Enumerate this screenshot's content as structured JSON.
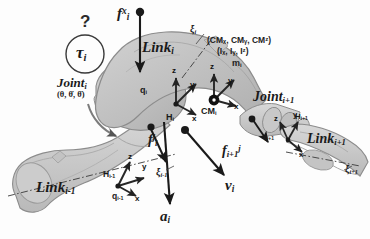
{
  "figure": {
    "background_color": "#fdfdfd",
    "link_fill_color": "#c9c9c9",
    "link_stroke_color": "#8a8a8a",
    "arrow_color": "#1a1a1a",
    "axis_arrow_color": "#2a2a2a",
    "text_color": "#1a1a1a"
  },
  "labels": {
    "question_mark": "?",
    "torque": {
      "base": "τ",
      "sub": "i"
    },
    "joint_i": {
      "base": "Joint",
      "sub": "i"
    },
    "joint_state": "(θ, θ̇, θ̈)",
    "force_ext": {
      "base": "f",
      "sub": "i",
      "sup": "x"
    },
    "force_in": {
      "base": "f",
      "sub": "i",
      "sup": "j"
    },
    "force_out": {
      "base": "f",
      "sub": "i+1",
      "sup": "j"
    },
    "velocity": {
      "base": "v",
      "sub": "i"
    },
    "acceleration": {
      "base": "a",
      "sub": "i"
    },
    "link_i": {
      "base": "Link",
      "sub": "i"
    },
    "link_prev": {
      "base": "Link",
      "sub": "i-1"
    },
    "link_next": {
      "base": "Link",
      "sub": "i+1"
    },
    "joint_next": {
      "base": "Joint",
      "sub": "i+1"
    },
    "cm": {
      "base": "CM",
      "sub": "i"
    },
    "frame_H_i": {
      "base": "H",
      "sub": "i"
    },
    "frame_H_prev": {
      "base": "H",
      "sub": "i-1"
    },
    "frame_H_next": {
      "base": "H",
      "sub": "i+1"
    },
    "q_i": {
      "base": "q",
      "sub": "i"
    },
    "q_prev": {
      "base": "q",
      "sub": "i-1"
    },
    "q_next": {
      "base": "q",
      "sub": "i+1"
    },
    "xi_i": {
      "base": "ξ",
      "sub": "i"
    },
    "xi_prev": {
      "base": "ξ",
      "sub": "i-1"
    },
    "xi_next": {
      "base": "ξ",
      "sub": "i+1"
    },
    "inertial_cm": "(CMₓ, CMᵧ, CMᶻ)",
    "inertial_I": "(Iₓ, Iᵧ, Iᶻ)",
    "inertial_mass": {
      "base": "m",
      "sub": "i"
    }
  },
  "axes": {
    "x": "x",
    "y": "y",
    "z": "z"
  },
  "frames": [
    {
      "name": "H_i",
      "origin_label": "H",
      "index": "i",
      "shows": [
        "x",
        "y",
        "z"
      ]
    },
    {
      "name": "CM_i",
      "origin_label": "CM",
      "index": "i",
      "shows": [
        "x",
        "y",
        "z"
      ]
    },
    {
      "name": "H_i-1",
      "origin_label": "H",
      "index": "i-1",
      "shows": [
        "x",
        "y",
        "z"
      ]
    },
    {
      "name": "H_i+1",
      "origin_label": "H",
      "index": "i+1",
      "shows": [
        "x",
        "y",
        "z"
      ]
    }
  ]
}
